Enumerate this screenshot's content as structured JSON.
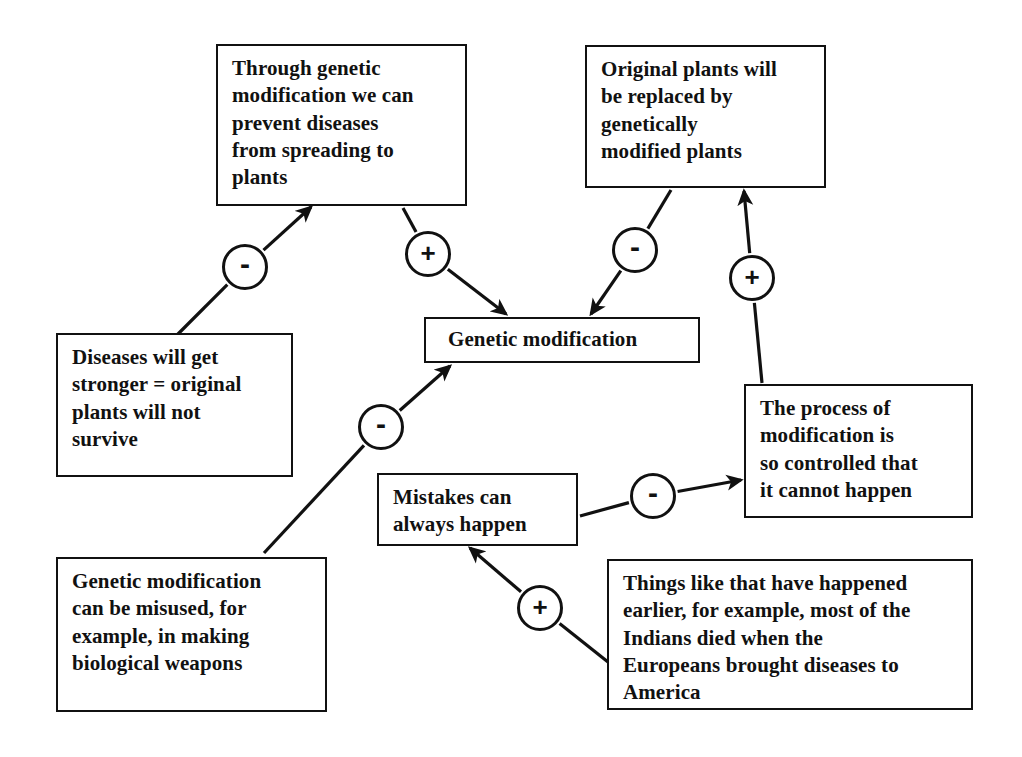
{
  "diagram": {
    "background_color": "#ffffff",
    "stroke_color": "#111111",
    "nodes": [
      {
        "id": "prevent-diseases",
        "text": "Through genetic\nmodification we can\nprevent diseases\nfrom spreading to\nplants",
        "x": 216,
        "y": 44,
        "w": 251,
        "h": 162
      },
      {
        "id": "original-plants-replaced",
        "text": "Original plants will\nbe replaced by\ngenetically\nmodified plants",
        "x": 585,
        "y": 45,
        "w": 241,
        "h": 143
      },
      {
        "id": "genetic-modification",
        "text": "Genetic modification",
        "x": 424,
        "y": 317,
        "w": 276,
        "h": 46
      },
      {
        "id": "diseases-stronger",
        "text": "Diseases will get\nstronger  = original\nplants will not\nsurvive",
        "x": 56,
        "y": 333,
        "w": 237,
        "h": 144
      },
      {
        "id": "process-controlled",
        "text": "The process of\nmodification is\nso controlled that\nit cannot happen",
        "x": 744,
        "y": 384,
        "w": 229,
        "h": 134
      },
      {
        "id": "mistakes-happen",
        "text": "Mistakes can\nalways happen",
        "x": 377,
        "y": 473,
        "w": 201,
        "h": 73
      },
      {
        "id": "misused-weapons",
        "text": "Genetic modification\ncan be misused, for\nexample, in making\nbiological weapons",
        "x": 56,
        "y": 557,
        "w": 271,
        "h": 155
      },
      {
        "id": "happened-earlier",
        "text": "Things like that have happened\nearlier, for example, most of the\nIndians died when the\nEuropeans brought diseases to\nAmerica",
        "x": 607,
        "y": 559,
        "w": 366,
        "h": 151
      }
    ],
    "links": [
      {
        "id": "diseases-stronger-to-prevent-diseases",
        "from": "diseases-stronger",
        "to": "prevent-diseases",
        "sign": "-",
        "sign_x": 245,
        "sign_y": 267,
        "x1": 176,
        "y1": 336,
        "x2": 311,
        "y2": 207
      },
      {
        "id": "prevent-diseases-to-genetic-modification",
        "from": "prevent-diseases",
        "to": "genetic-modification",
        "sign": "+",
        "sign_x": 428,
        "sign_y": 254,
        "x1": 403,
        "y1": 208,
        "x2": 506,
        "y2": 314
      },
      {
        "id": "original-plants-to-genetic-modification",
        "from": "original-plants-replaced",
        "to": "genetic-modification",
        "sign": "-",
        "sign_x": 635,
        "sign_y": 250,
        "x1": 671,
        "y1": 190,
        "x2": 591,
        "y2": 314
      },
      {
        "id": "process-controlled-to-original-plants",
        "from": "process-controlled",
        "to": "original-plants-replaced",
        "sign": "+",
        "sign_x": 752,
        "sign_y": 278,
        "x1": 762,
        "y1": 383,
        "x2": 744,
        "y2": 191
      },
      {
        "id": "misused-weapons-to-genetic-modification",
        "from": "misused-weapons",
        "to": "genetic-modification",
        "sign": "-",
        "sign_x": 381,
        "sign_y": 427,
        "x1": 264,
        "y1": 553,
        "x2": 450,
        "y2": 366
      },
      {
        "id": "mistakes-to-process-controlled",
        "from": "mistakes-happen",
        "to": "process-controlled",
        "sign": "-",
        "sign_x": 653,
        "sign_y": 496,
        "x1": 580,
        "y1": 516,
        "x2": 741,
        "y2": 480
      },
      {
        "id": "happened-earlier-to-mistakes",
        "from": "happened-earlier",
        "to": "mistakes-happen",
        "sign": "+",
        "sign_x": 540,
        "sign_y": 608,
        "x1": 608,
        "y1": 662,
        "x2": 470,
        "y2": 548
      }
    ]
  }
}
